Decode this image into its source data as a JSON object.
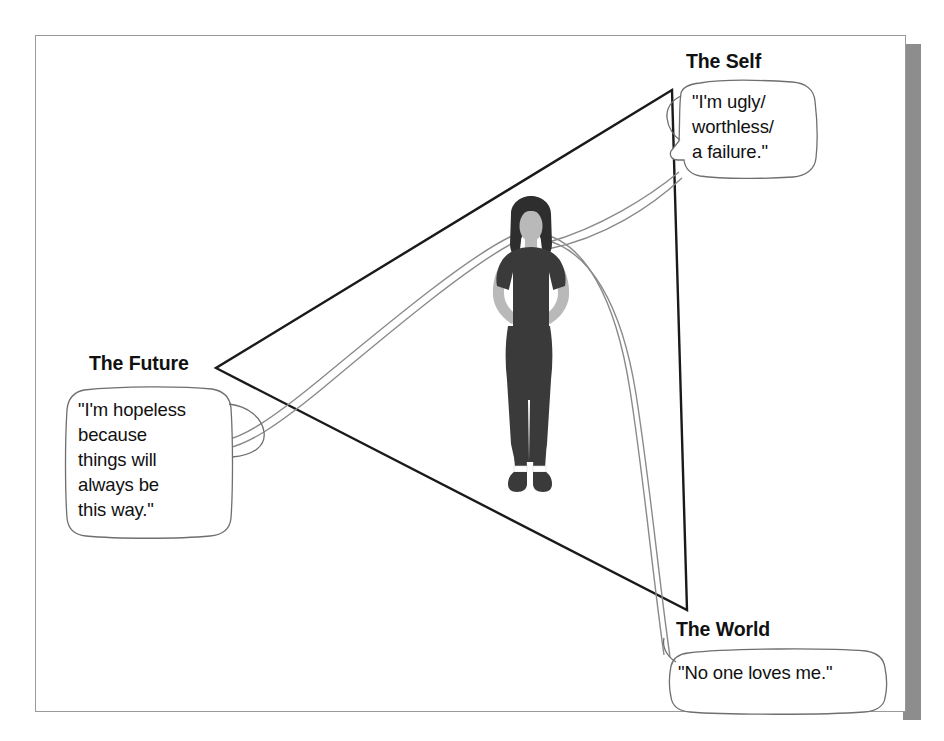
{
  "diagram": {
    "frame": {
      "border_color": "#9a9a9a",
      "shadow_color": "#8d8d8d",
      "background": "#ffffff"
    },
    "colors": {
      "ink": "#111111",
      "triangle_stroke": "#1a1a1a",
      "bubble_stroke": "#555555",
      "clothing": "#3a3a3a",
      "skin": "#b9b9b9",
      "hair": "#2e2e2e",
      "sock": "#ffffff",
      "tail_stroke": "#7a7a7a"
    },
    "nodes": [
      {
        "id": "self",
        "label": "The Self",
        "quote": "\"I'm ugly/\nworthless/\na failure.\"",
        "position": "top-right"
      },
      {
        "id": "future",
        "label": "The Future",
        "quote": "\"I'm hopeless\nbecause\nthings will\nalways be\nthis way.\"",
        "position": "middle-left"
      },
      {
        "id": "world",
        "label": "The World",
        "quote": "\"No one loves me.\"",
        "position": "bottom-right"
      }
    ],
    "figure": {
      "description": "standing person with hands on hips",
      "alt": "person-figure"
    },
    "triangle": {
      "vertices": [
        {
          "name": "self-vertex",
          "x": 672,
          "y": 90
        },
        {
          "name": "future-vertex",
          "x": 216,
          "y": 368
        },
        {
          "name": "world-vertex",
          "x": 687,
          "y": 610
        }
      ]
    }
  }
}
